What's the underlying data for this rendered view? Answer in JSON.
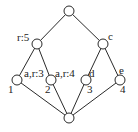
{
  "diagram": {
    "type": "lattice",
    "nodes": [
      {
        "id": "top",
        "x": 69,
        "y": 11,
        "label": ""
      },
      {
        "id": "n_r5",
        "x": 37,
        "y": 44,
        "label": "r:5",
        "lx": 18,
        "ly": 40
      },
      {
        "id": "n_c",
        "x": 103,
        "y": 44,
        "label": "c",
        "lx": 108,
        "ly": 40
      },
      {
        "id": "n_1",
        "x": 17,
        "y": 80,
        "label": "a,r:3",
        "lx": 25,
        "ly": 75,
        "sublabel": "1",
        "sx": 9,
        "sy": 93
      },
      {
        "id": "n_2",
        "x": 51,
        "y": 80,
        "label": "a,r:4",
        "lx": 55,
        "ly": 75,
        "sublabel": "2",
        "sx": 45,
        "sy": 93
      },
      {
        "id": "n_3",
        "x": 86,
        "y": 80,
        "label": "d",
        "lx": 90,
        "ly": 75,
        "sublabel": "3",
        "sx": 87,
        "sy": 93
      },
      {
        "id": "n_4",
        "x": 120,
        "y": 80,
        "label": "e",
        "lx": 120,
        "ly": 73,
        "sublabel": "4",
        "sx": 120,
        "sy": 93
      },
      {
        "id": "bottom",
        "x": 69,
        "y": 118,
        "label": ""
      }
    ],
    "edges": [
      [
        "top",
        "n_r5"
      ],
      [
        "top",
        "n_c"
      ],
      [
        "n_r5",
        "n_1"
      ],
      [
        "n_r5",
        "n_2"
      ],
      [
        "n_c",
        "n_3"
      ],
      [
        "n_c",
        "n_4"
      ],
      [
        "n_1",
        "bottom"
      ],
      [
        "n_2",
        "bottom"
      ],
      [
        "n_3",
        "bottom"
      ],
      [
        "n_4",
        "bottom"
      ]
    ],
    "labels": {
      "n_r5": "r:5",
      "n_c": "c",
      "n_1_top": "a,r:3",
      "n_1_bottom": "1",
      "n_2_top": "a,r:4",
      "n_2_bottom": "2",
      "n_3_top": "d",
      "n_3_bottom": "3",
      "n_4_top": "e",
      "n_4_bottom": "4"
    },
    "node_radius": 5,
    "colors": {
      "stroke": "#2a2a2a",
      "fill": "#ffffff",
      "text": "#222222"
    }
  }
}
